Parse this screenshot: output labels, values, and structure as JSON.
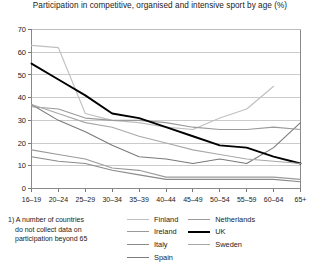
{
  "chart_data": {
    "type": "line",
    "title": "Participation in competitive, organised and intensive sport by age (%)",
    "xlabel": "",
    "ylabel": "",
    "ylim": [
      0,
      70
    ],
    "yticks": [
      0,
      10,
      20,
      30,
      40,
      50,
      60,
      70
    ],
    "grid": true,
    "legend_position": "bottom",
    "categories": [
      "16–19",
      "20–24",
      "25–29",
      "30–34",
      "35–39",
      "40–44",
      "45–49",
      "50–54",
      "55–59",
      "60–64",
      "65+"
    ],
    "series": [
      {
        "name": "Finland",
        "color": "#bfbfbf",
        "width": 1.1,
        "values": [
          63,
          62,
          33,
          30,
          29,
          27,
          26,
          31,
          35,
          45,
          null
        ]
      },
      {
        "name": "Ireland",
        "color": "#9a9a9a",
        "width": 1.1,
        "values": [
          17,
          15,
          13,
          9,
          8,
          5,
          5,
          5,
          5,
          5,
          4
        ]
      },
      {
        "name": "Italy",
        "color": "#8a8a8a",
        "width": 1.1,
        "values": [
          14,
          12,
          11,
          8,
          6,
          4,
          4,
          4,
          4,
          4,
          3
        ]
      },
      {
        "name": "Spain",
        "color": "#7a7a7a",
        "width": 1.1,
        "values": [
          37,
          30,
          25,
          19,
          14,
          13,
          11,
          13,
          11,
          18,
          29
        ]
      },
      {
        "name": "Netherlands",
        "color": "#9a9a9a",
        "width": 1.1,
        "values": [
          36,
          35,
          31,
          30,
          30,
          29,
          27,
          26,
          26,
          27,
          26
        ]
      },
      {
        "name": "UK",
        "color": "#000000",
        "width": 1.9,
        "values": [
          55,
          48,
          41,
          33,
          31,
          27,
          23,
          19,
          18,
          14,
          11
        ]
      },
      {
        "name": "Sweden",
        "color": "#a8a8a8",
        "width": 1.1,
        "values": [
          37,
          33,
          29,
          27,
          23,
          20,
          17,
          15,
          13,
          12,
          11
        ]
      }
    ]
  },
  "footnote": {
    "line1": "1) A number of countries",
    "line2": "do not collect data on",
    "line3": "participation beyond 65"
  },
  "legend": {
    "col1": [
      "Finland",
      "Ireland",
      "Italy",
      "Spain"
    ],
    "col2": [
      "Netherlands",
      "UK",
      "Sweden"
    ]
  }
}
